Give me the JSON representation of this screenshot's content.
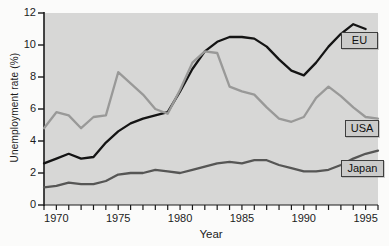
{
  "chart_data": {
    "type": "line",
    "title": "",
    "xlabel": "Year",
    "ylabel": "Unemployment rate (%)",
    "xlim": [
      1969,
      1996
    ],
    "ylim": [
      0,
      12
    ],
    "x_major_ticks": [
      1970,
      1975,
      1980,
      1985,
      1990,
      1995
    ],
    "x_minor_tick_step": 1,
    "y_ticks": [
      0,
      2,
      4,
      6,
      8,
      10,
      12
    ],
    "grid": false,
    "legend_position": "boxed-labels-right",
    "plot_background": "#d7d7d6",
    "axis_color": "#1a1a1a",
    "series": [
      {
        "name": "EU",
        "color": "#141414",
        "x": [
          1969,
          1970,
          1971,
          1972,
          1973,
          1974,
          1975,
          1976,
          1977,
          1978,
          1979,
          1980,
          1981,
          1982,
          1983,
          1984,
          1985,
          1986,
          1987,
          1988,
          1989,
          1990,
          1991,
          1992,
          1993,
          1994,
          1995
        ],
        "values": [
          2.6,
          2.9,
          3.2,
          2.9,
          3.0,
          3.9,
          4.6,
          5.1,
          5.4,
          5.6,
          5.8,
          7.1,
          8.5,
          9.6,
          10.2,
          10.5,
          10.5,
          10.4,
          9.9,
          9.1,
          8.4,
          8.1,
          8.9,
          9.9,
          10.7,
          11.3,
          11.0
        ]
      },
      {
        "name": "USA",
        "color": "#999998",
        "x": [
          1969,
          1970,
          1971,
          1972,
          1973,
          1974,
          1975,
          1976,
          1977,
          1978,
          1979,
          1980,
          1981,
          1982,
          1983,
          1984,
          1985,
          1986,
          1987,
          1988,
          1989,
          1990,
          1991,
          1992,
          1993,
          1994,
          1995,
          1996
        ],
        "values": [
          4.8,
          5.8,
          5.6,
          4.8,
          5.5,
          5.6,
          8.3,
          7.6,
          6.9,
          6.0,
          5.7,
          7.2,
          8.9,
          9.6,
          9.5,
          7.4,
          7.1,
          6.9,
          6.1,
          5.4,
          5.2,
          5.5,
          6.7,
          7.4,
          6.8,
          6.1,
          5.5,
          5.4
        ]
      },
      {
        "name": "Japan",
        "color": "#565655",
        "x": [
          1969,
          1970,
          1971,
          1972,
          1973,
          1974,
          1975,
          1976,
          1977,
          1978,
          1979,
          1980,
          1981,
          1982,
          1983,
          1984,
          1985,
          1986,
          1987,
          1988,
          1989,
          1990,
          1991,
          1992,
          1993,
          1994,
          1995,
          1996
        ],
        "values": [
          1.1,
          1.2,
          1.4,
          1.3,
          1.3,
          1.5,
          1.9,
          2.0,
          2.0,
          2.2,
          2.1,
          2.0,
          2.2,
          2.4,
          2.6,
          2.7,
          2.6,
          2.8,
          2.8,
          2.5,
          2.3,
          2.1,
          2.1,
          2.2,
          2.5,
          2.9,
          3.2,
          3.4
        ]
      }
    ]
  }
}
